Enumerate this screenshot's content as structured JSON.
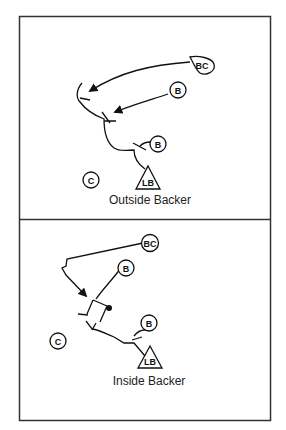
{
  "panels": [
    {
      "caption": "Outside Backer",
      "players": {
        "bc": "BC",
        "b1": "B",
        "b2": "B",
        "c": "C",
        "lb": "LB"
      }
    },
    {
      "caption": "Inside Backer",
      "players": {
        "bc": "BC",
        "b1": "B",
        "b2": "B",
        "c": "C",
        "lb": "LB"
      }
    }
  ],
  "colors": {
    "ink": "#111111",
    "border": "#333333",
    "background": "#ffffff"
  }
}
